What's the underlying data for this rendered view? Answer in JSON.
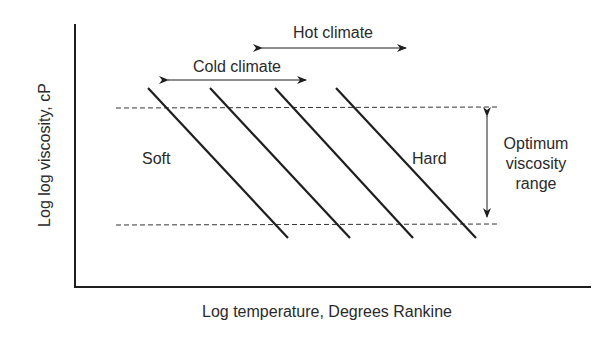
{
  "diagram": {
    "x_axis_label": "Log temperature, Degrees Rankine",
    "y_axis_label": "Log log viscosity, cP",
    "annotations": {
      "hot_climate": "Hot climate",
      "cold_climate": "Cold climate",
      "soft": "Soft",
      "hard": "Hard",
      "optimum_line1": "Optimum",
      "optimum_line2": "viscosity",
      "optimum_line3": "range"
    },
    "grade_lines_count": 4,
    "colors": {
      "line": "#1e1e1e",
      "text": "#2a2a2a",
      "background": "#ffffff"
    }
  }
}
